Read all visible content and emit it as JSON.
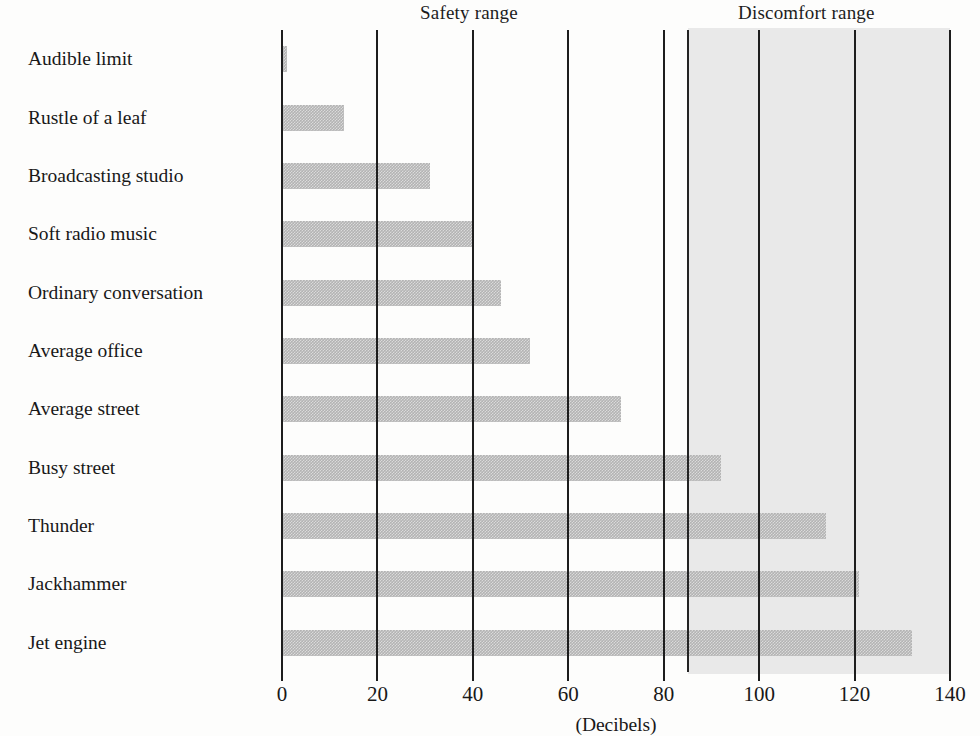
{
  "chart_data": {
    "type": "bar",
    "orientation": "horizontal",
    "title": "",
    "xlabel": "(Decibels)",
    "ylabel": "",
    "xlim": [
      0,
      140
    ],
    "xticks": [
      0,
      20,
      40,
      60,
      80,
      100,
      120,
      140
    ],
    "xtick_labels": [
      "0",
      "20",
      "40",
      "60",
      "80",
      "100",
      "120",
      "140"
    ],
    "grid": "vertical gridlines at every x tick",
    "legend": "none",
    "categories": [
      "Audible limit",
      "Rustle of a leaf",
      "Broadcasting studio",
      "Soft radio music",
      "Ordinary conversation",
      "Average office",
      "Average street",
      "Busy street",
      "Thunder",
      "Jackhammer",
      "Jet engine"
    ],
    "values": [
      1,
      13,
      31,
      40,
      46,
      52,
      71,
      92,
      114,
      121,
      132
    ],
    "annotations": [
      {
        "name": "safety-range",
        "label": "Safety range",
        "x_start": 0,
        "x_end": 85
      },
      {
        "name": "discomfort-range",
        "label": "Discomfort range",
        "x_start": 85,
        "x_end": 140
      }
    ],
    "shaded_region": {
      "label": "Discomfort range",
      "x_start": 85,
      "x_end": 140,
      "color": "#e9e9e9"
    },
    "bar_color": "#b3b3b3",
    "axis_color": "#1d1d1d",
    "background_color": "#fdfdfc"
  },
  "headers": {
    "safety": "Safety range",
    "discomfort": "Discomfort range"
  },
  "axis": {
    "x_title": "(Decibels)"
  }
}
